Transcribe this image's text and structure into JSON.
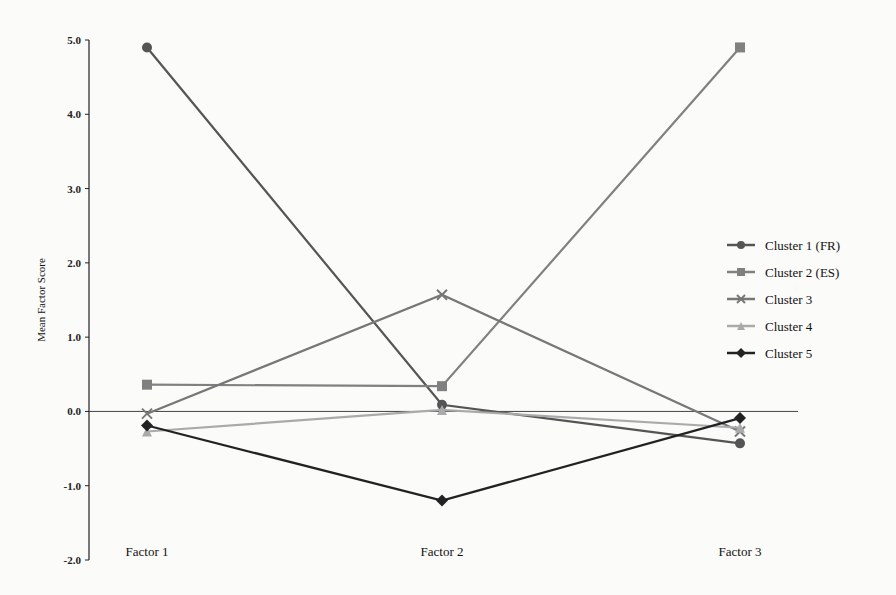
{
  "chart_data": {
    "type": "line",
    "title": "",
    "xlabel": "",
    "ylabel": "Mean Factor Score",
    "categories": [
      "Factor 1",
      "Factor 2",
      "Factor 3"
    ],
    "ylim": [
      -2.0,
      5.0
    ],
    "yticks": [
      "5.0",
      "4.0",
      "3.0",
      "2.0",
      "1.0",
      "0.0",
      "-1.0",
      "-2.0"
    ],
    "grid": false,
    "legend_position": "right",
    "series": [
      {
        "name": "Cluster 1 (FR)",
        "values": [
          4.9,
          0.09,
          -0.43
        ],
        "marker": "circle",
        "color": "#555555"
      },
      {
        "name": "Cluster 2 (ES)",
        "values": [
          0.36,
          0.34,
          4.9
        ],
        "marker": "square",
        "color": "#808080"
      },
      {
        "name": "Cluster 3",
        "values": [
          -0.03,
          1.57,
          -0.27
        ],
        "marker": "x",
        "color": "#777777"
      },
      {
        "name": "Cluster 4",
        "values": [
          -0.27,
          0.02,
          -0.22
        ],
        "marker": "triangle",
        "color": "#aaaaaa"
      },
      {
        "name": "Cluster 5",
        "values": [
          -0.19,
          -1.2,
          -0.09
        ],
        "marker": "diamond",
        "color": "#222222"
      }
    ]
  }
}
